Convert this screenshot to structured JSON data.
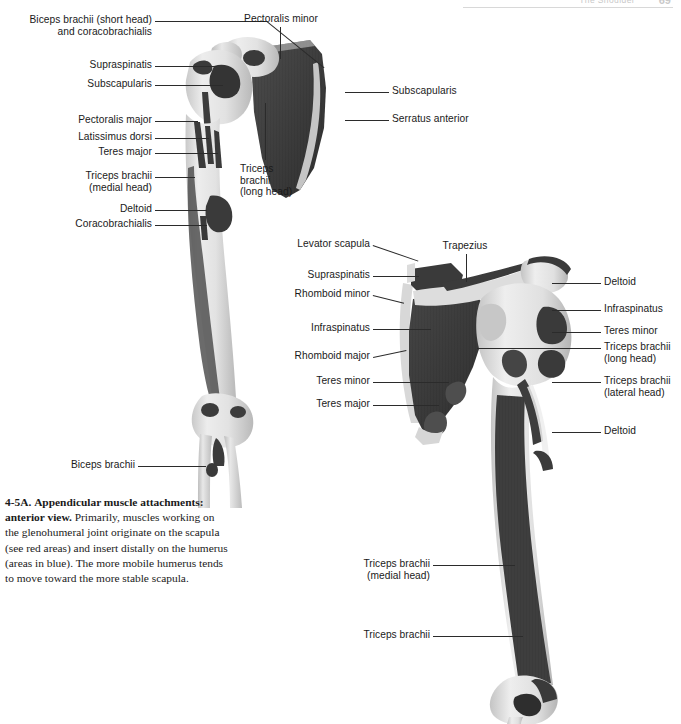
{
  "running_head": {
    "title": "The Shoulder",
    "page_number": "69"
  },
  "caption": {
    "figure_number": "4-5A.",
    "title": "Appendicular muscle attachments: anterior view.",
    "body": "Primarily, muscles working on the glenohumeral joint originate on the scapula (see red areas) and insert distally on the humerus (areas in blue). The more mobile humerus tends to move toward the more stable scapula."
  },
  "figures": [
    {
      "id": "anterior-view",
      "name": "anterior-scapula-humerus",
      "labels_left": [
        {
          "name": "biceps-brachii-short-head",
          "text": "Biceps brachii (short head)\nand coracobrachialis"
        },
        {
          "name": "supraspinatus",
          "text": "Supraspinatis"
        },
        {
          "name": "subscapularis",
          "text": "Subscapularis"
        },
        {
          "name": "pectoralis-major",
          "text": "Pectoralis major"
        },
        {
          "name": "latissimus-dorsi",
          "text": "Latissimus dorsi"
        },
        {
          "name": "teres-major",
          "text": "Teres major"
        },
        {
          "name": "triceps-brachii-medial-head",
          "text": "Triceps brachii\n(medial head)"
        },
        {
          "name": "deltoid",
          "text": "Deltoid"
        },
        {
          "name": "coracobrachialis",
          "text": "Coracobrachialis"
        },
        {
          "name": "biceps-brachii",
          "text": "Biceps brachii"
        }
      ],
      "labels_top": [
        {
          "name": "pectoralis-minor",
          "text": "Pectoralis minor"
        }
      ],
      "labels_inner": [
        {
          "name": "triceps-brachii-long-head",
          "text": "Triceps\nbrachii\n(long head)"
        }
      ],
      "labels_right": [
        {
          "name": "subscapularis-right",
          "text": "Subscapularis"
        },
        {
          "name": "serratus-anterior",
          "text": "Serratus anterior"
        }
      ]
    },
    {
      "id": "posterior-view",
      "name": "posterior-scapula-humerus",
      "labels_left": [
        {
          "name": "levator-scapula",
          "text": "Levator scapula"
        },
        {
          "name": "supraspinatus",
          "text": "Supraspinatis"
        },
        {
          "name": "rhomboid-minor",
          "text": "Rhomboid minor"
        },
        {
          "name": "infraspinatus",
          "text": "Infraspinatus"
        },
        {
          "name": "rhomboid-major",
          "text": "Rhomboid major"
        },
        {
          "name": "teres-minor",
          "text": "Teres minor"
        },
        {
          "name": "teres-major",
          "text": "Teres major"
        },
        {
          "name": "triceps-brachii-medial-head",
          "text": "Triceps brachii\n(medial head)"
        },
        {
          "name": "triceps-brachii",
          "text": "Triceps brachii"
        }
      ],
      "labels_top": [
        {
          "name": "trapezius",
          "text": "Trapezius"
        }
      ],
      "labels_right": [
        {
          "name": "deltoid-upper",
          "text": "Deltoid"
        },
        {
          "name": "infraspinatus-right",
          "text": "Infraspinatus"
        },
        {
          "name": "teres-minor-right",
          "text": "Teres minor"
        },
        {
          "name": "triceps-brachii-long-head",
          "text": "Triceps brachii\n(long head)"
        },
        {
          "name": "triceps-brachii-lateral-head",
          "text": "Triceps brachii\n(lateral head)"
        },
        {
          "name": "deltoid-lower",
          "text": "Deltoid"
        }
      ]
    }
  ],
  "colors": {
    "label_text": "#1a1a1a",
    "leader_line": "#2b2b2b",
    "attachment_dark": "#3b3b3b",
    "bone_light": "#dcdcdc",
    "bone_mid": "#b8b8b8",
    "background": "#ffffff"
  }
}
